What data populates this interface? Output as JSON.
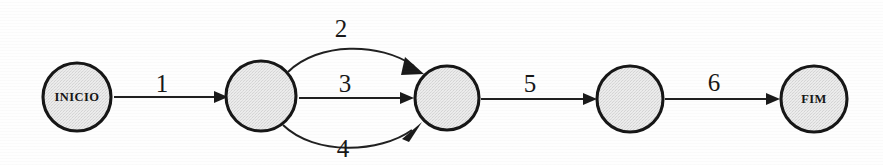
{
  "diagram": {
    "type": "state-transition-diagram",
    "background_color": "#fefefe",
    "node_fill_color": "#e3e3e3",
    "node_stroke_color": "#161616",
    "edge_color": "#1f1f1f",
    "nodes": [
      {
        "id": "inicio",
        "label": "INICIO",
        "cx": 77,
        "cy": 97,
        "r": 34
      },
      {
        "id": "n2",
        "label": "",
        "cx": 261,
        "cy": 96,
        "r": 35
      },
      {
        "id": "n3",
        "label": "",
        "cx": 447,
        "cy": 98,
        "r": 32
      },
      {
        "id": "n4",
        "label": "",
        "cx": 630,
        "cy": 99,
        "r": 33
      },
      {
        "id": "fim",
        "label": "FIM",
        "cx": 814,
        "cy": 99,
        "r": 33
      }
    ],
    "edges": [
      {
        "id": "e1",
        "label": "1",
        "from": "inicio",
        "to": "n2",
        "shape": "straight",
        "label_x": 162,
        "label_y": 92
      },
      {
        "id": "e2",
        "label": "2",
        "from": "n2",
        "to": "n3",
        "shape": "curve-up",
        "label_x": 341,
        "label_y": 37
      },
      {
        "id": "e3",
        "label": "3",
        "from": "n2",
        "to": "n3",
        "shape": "straight",
        "label_x": 345,
        "label_y": 92
      },
      {
        "id": "e4",
        "label": "4",
        "from": "n2",
        "to": "n3",
        "shape": "curve-down",
        "label_x": 343,
        "label_y": 157
      },
      {
        "id": "e5",
        "label": "5",
        "from": "n3",
        "to": "n4",
        "shape": "straight",
        "label_x": 530,
        "label_y": 92
      },
      {
        "id": "e6",
        "label": "6",
        "from": "n4",
        "to": "fim",
        "shape": "straight",
        "label_x": 714,
        "label_y": 91
      }
    ]
  }
}
